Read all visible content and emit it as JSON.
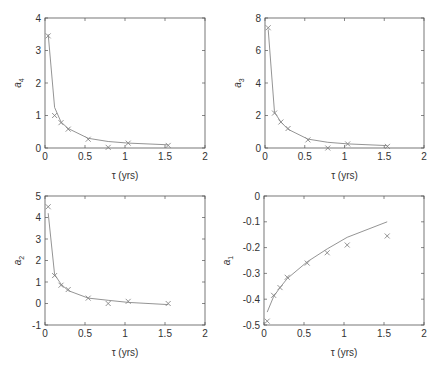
{
  "figure": {
    "background": "#ffffff",
    "line_color": "#888888",
    "marker_color": "#777777",
    "marker_symbol": "x"
  },
  "chart_data": [
    {
      "type": "line",
      "panel": "top-left",
      "title": "",
      "xlabel": "τ (yrs)",
      "ylabel": "a4",
      "ylabel_main": "a",
      "ylabel_sub": "4",
      "xlim": [
        0,
        2
      ],
      "ylim": [
        0,
        4
      ],
      "xticks": [
        0,
        0.5,
        1,
        1.5,
        2
      ],
      "xtick_labels": [
        "0",
        "0.5",
        "1",
        "1.5",
        "2"
      ],
      "yticks": [
        0,
        1,
        2,
        3,
        4
      ],
      "ytick_labels": [
        "0",
        "1",
        "2",
        "3",
        "4"
      ],
      "grid": false,
      "series": [
        {
          "name": "observed",
          "style": "markers-x",
          "x": [
            0.04,
            0.12,
            0.2,
            0.29,
            0.54,
            0.79,
            1.04,
            1.54
          ],
          "y": [
            3.45,
            1.0,
            0.78,
            0.58,
            0.27,
            0.02,
            0.15,
            0.08
          ]
        },
        {
          "name": "fit",
          "style": "line",
          "x": [
            0.04,
            0.12,
            0.2,
            0.29,
            0.54,
            0.79,
            1.04,
            1.54
          ],
          "y": [
            3.5,
            1.25,
            0.8,
            0.6,
            0.3,
            0.2,
            0.15,
            0.1
          ]
        }
      ]
    },
    {
      "type": "line",
      "panel": "top-right",
      "title": "",
      "xlabel": "τ (yrs)",
      "ylabel": "a3",
      "ylabel_main": "a",
      "ylabel_sub": "3",
      "xlim": [
        0,
        2
      ],
      "ylim": [
        0,
        8
      ],
      "xticks": [
        0,
        0.5,
        1,
        1.5,
        2
      ],
      "xtick_labels": [
        "0",
        "0.5",
        "1",
        "1.5",
        "2"
      ],
      "yticks": [
        0,
        2,
        4,
        6,
        8
      ],
      "ytick_labels": [
        "0",
        "2",
        "4",
        "6",
        "8"
      ],
      "grid": false,
      "series": [
        {
          "name": "observed",
          "style": "markers-x",
          "x": [
            0.04,
            0.12,
            0.2,
            0.29,
            0.54,
            0.79,
            1.04,
            1.54
          ],
          "y": [
            7.4,
            2.15,
            1.6,
            1.2,
            0.5,
            0.0,
            0.25,
            0.1
          ]
        },
        {
          "name": "fit",
          "style": "line",
          "x": [
            0.04,
            0.12,
            0.2,
            0.29,
            0.54,
            0.79,
            1.04,
            1.54
          ],
          "y": [
            7.3,
            2.2,
            1.6,
            1.15,
            0.55,
            0.35,
            0.25,
            0.15
          ]
        }
      ]
    },
    {
      "type": "line",
      "panel": "bottom-left",
      "title": "",
      "xlabel": "τ (yrs)",
      "ylabel": "a2",
      "ylabel_main": "a",
      "ylabel_sub": "2",
      "xlim": [
        0,
        2
      ],
      "ylim": [
        -1,
        5
      ],
      "xticks": [
        0,
        0.5,
        1,
        1.5,
        2
      ],
      "xtick_labels": [
        "0",
        "0.5",
        "1",
        "1.5",
        "2"
      ],
      "yticks": [
        -1,
        0,
        1,
        2,
        3,
        4,
        5
      ],
      "ytick_labels": [
        "-1",
        "0",
        "1",
        "2",
        "3",
        "4",
        "5"
      ],
      "grid": false,
      "series": [
        {
          "name": "observed",
          "style": "markers-x",
          "x": [
            0.04,
            0.12,
            0.2,
            0.29,
            0.54,
            0.79,
            1.04,
            1.54
          ],
          "y": [
            4.5,
            1.3,
            0.85,
            0.65,
            0.25,
            0.0,
            0.1,
            0.0
          ]
        },
        {
          "name": "fit",
          "style": "line",
          "x": [
            0.04,
            0.12,
            0.2,
            0.29,
            0.54,
            0.79,
            1.04,
            1.54
          ],
          "y": [
            4.2,
            1.35,
            0.9,
            0.6,
            0.25,
            0.15,
            0.05,
            -0.05
          ]
        }
      ]
    },
    {
      "type": "line",
      "panel": "bottom-right",
      "title": "",
      "xlabel": "τ (yrs)",
      "ylabel": "a1",
      "ylabel_main": "a",
      "ylabel_sub": "1",
      "xlim": [
        0,
        2
      ],
      "ylim": [
        -0.5,
        0
      ],
      "xticks": [
        0,
        0.5,
        1,
        1.5,
        2
      ],
      "xtick_labels": [
        "0",
        "0.5",
        "1",
        "1.5",
        "2"
      ],
      "yticks": [
        -0.5,
        -0.4,
        -0.3,
        -0.2,
        -0.1,
        0
      ],
      "ytick_labels": [
        "-0.5",
        "-0.4",
        "-0.3",
        "-0.2",
        "-0.1",
        "0"
      ],
      "grid": false,
      "series": [
        {
          "name": "observed",
          "style": "markers-x",
          "x": [
            0.04,
            0.12,
            0.2,
            0.29,
            0.54,
            0.79,
            1.04,
            1.54
          ],
          "y": [
            -0.485,
            -0.385,
            -0.355,
            -0.315,
            -0.26,
            -0.22,
            -0.19,
            -0.155
          ]
        },
        {
          "name": "fit",
          "style": "line",
          "x": [
            0.04,
            0.12,
            0.2,
            0.29,
            0.54,
            0.79,
            1.04,
            1.54
          ],
          "y": [
            -0.45,
            -0.39,
            -0.355,
            -0.32,
            -0.255,
            -0.205,
            -0.16,
            -0.1
          ]
        }
      ]
    }
  ],
  "layout": {
    "panels": [
      {
        "left": 45,
        "top": 18,
        "right": 205,
        "bottom": 148
      },
      {
        "left": 265,
        "top": 18,
        "right": 424,
        "bottom": 148
      },
      {
        "left": 45,
        "top": 196,
        "right": 205,
        "bottom": 325
      },
      {
        "left": 264,
        "top": 196,
        "right": 424,
        "bottom": 325
      }
    ]
  }
}
